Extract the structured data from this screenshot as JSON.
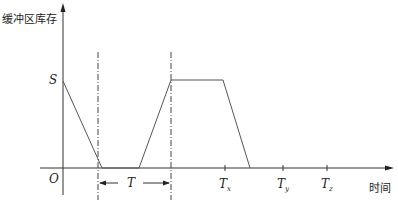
{
  "diagram": {
    "type": "buffer-inventory-timeline",
    "y_axis_label": "缓冲区库存",
    "x_axis_label": "时间",
    "origin_label": "O",
    "level_label": "S",
    "period_label": "T",
    "ticks": [
      {
        "base": "T",
        "sub": "x"
      },
      {
        "base": "T",
        "sub": "y"
      },
      {
        "base": "T",
        "sub": "z"
      }
    ],
    "colors": {
      "line": "#555555",
      "axis": "#333333",
      "text": "#222222"
    }
  }
}
